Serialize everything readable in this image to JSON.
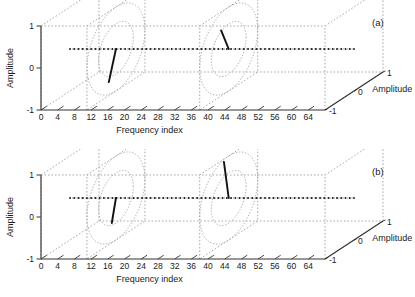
{
  "figure": {
    "kind": "3d-phasor-plot-pair",
    "background": "#ffffff",
    "ink": "#1a1a1a",
    "grid_color": "#9a9a9a"
  },
  "chart_data": [
    {
      "type": "line",
      "panel_label": "(a)",
      "title": "",
      "xlabel": "Frequency index",
      "ylabel": "Amplitude",
      "zlabel": "Amplitude",
      "xlim": [
        0,
        68
      ],
      "ylim": [
        -1,
        1
      ],
      "zlim": [
        -1,
        1
      ],
      "xticks": [
        0,
        4,
        8,
        12,
        16,
        20,
        24,
        28,
        32,
        36,
        40,
        44,
        48,
        52,
        56,
        60,
        64
      ],
      "xticklabels": [
        "0",
        "4",
        "8",
        "12",
        "16",
        "20",
        "24",
        "28",
        "32",
        "36",
        "40",
        "44",
        "48",
        "52",
        "56",
        "60",
        "64"
      ],
      "yticks": [
        -1,
        0,
        1
      ],
      "yticklabels": [
        "-1",
        "0",
        "1"
      ],
      "zticks": [
        -1,
        0,
        1
      ],
      "zticklabels": [
        "-1",
        "0",
        "1"
      ],
      "grid": true,
      "legend": "none",
      "series": [
        {
          "name": "spectrum-baseline",
          "style": "dotted-markers",
          "x_start": 0,
          "x_end": 68,
          "n_points": 68,
          "y": 0,
          "z": 0
        }
      ],
      "annotations": [
        {
          "name": "unit-circle-left",
          "kind": "circle",
          "frequency_index": 11,
          "radius": 1.0,
          "inner_radius": 0.6,
          "rings": 2
        },
        {
          "name": "phasor-left",
          "kind": "vector",
          "frequency_index": 11,
          "amplitude": 0.72,
          "angle_deg": 250
        },
        {
          "name": "unit-circle-right",
          "kind": "circle",
          "frequency_index": 38,
          "radius": 1.0,
          "inner_radius": 0.6,
          "rings": 2
        },
        {
          "name": "phasor-right",
          "kind": "vector",
          "frequency_index": 38,
          "amplitude": 0.62,
          "angle_deg": 115
        },
        {
          "name": "cut-plane-left",
          "kind": "plane",
          "frequency_index": 11
        },
        {
          "name": "cut-plane-right",
          "kind": "plane",
          "frequency_index": 38
        }
      ]
    },
    {
      "type": "line",
      "panel_label": "(b)",
      "title": "",
      "xlabel": "Frequency index",
      "ylabel": "Amplitude",
      "zlabel": "Amplitude",
      "xlim": [
        0,
        68
      ],
      "ylim": [
        -1,
        1
      ],
      "zlim": [
        -1,
        1
      ],
      "xticks": [
        0,
        4,
        8,
        12,
        16,
        20,
        24,
        28,
        32,
        36,
        40,
        44,
        48,
        52,
        56,
        60,
        64
      ],
      "xticklabels": [
        "0",
        "4",
        "8",
        "12",
        "16",
        "20",
        "24",
        "28",
        "32",
        "36",
        "40",
        "44",
        "48",
        "52",
        "56",
        "60",
        "64"
      ],
      "yticks": [
        -1,
        0,
        1
      ],
      "yticklabels": [
        "-1",
        "0",
        "1"
      ],
      "zticks": [
        -1,
        0,
        1
      ],
      "zticklabels": [
        "-1",
        "0",
        "1"
      ],
      "grid": true,
      "legend": "none",
      "series": [
        {
          "name": "spectrum-baseline",
          "style": "dotted-markers",
          "x_start": 0,
          "x_end": 68,
          "n_points": 68,
          "y": 0,
          "z": 0
        }
      ],
      "annotations": [
        {
          "name": "unit-circle-left",
          "kind": "circle",
          "frequency_index": 11,
          "radius": 1.0,
          "inner_radius": 0.6,
          "rings": 2
        },
        {
          "name": "phasor-left",
          "kind": "vector",
          "frequency_index": 11,
          "amplitude": 0.55,
          "angle_deg": 255
        },
        {
          "name": "unit-circle-right",
          "kind": "circle",
          "frequency_index": 38,
          "radius": 1.0,
          "inner_radius": 0.6,
          "rings": 2
        },
        {
          "name": "phasor-right",
          "kind": "vector",
          "frequency_index": 38,
          "amplitude": 0.95,
          "angle_deg": 100
        },
        {
          "name": "cut-plane-left",
          "kind": "plane",
          "frequency_index": 11
        },
        {
          "name": "cut-plane-right",
          "kind": "plane",
          "frequency_index": 38
        }
      ]
    }
  ],
  "panel_a": {
    "label": "(a)",
    "xlabel": "Frequency index",
    "ylabel": "Amplitude",
    "zlabel": "Amplitude",
    "xticklabels": [
      "0",
      "4",
      "8",
      "12",
      "16",
      "20",
      "24",
      "28",
      "32",
      "36",
      "40",
      "44",
      "48",
      "52",
      "56",
      "60",
      "64"
    ],
    "yticklabels": [
      "1",
      "0",
      "-1"
    ],
    "zticklabels": [
      "1",
      "0",
      "-1"
    ]
  },
  "panel_b": {
    "label": "(b)",
    "xlabel": "Frequency index",
    "ylabel": "Amplitude",
    "zlabel": "Amplitude",
    "xticklabels": [
      "0",
      "4",
      "8",
      "12",
      "16",
      "20",
      "24",
      "28",
      "32",
      "36",
      "40",
      "44",
      "48",
      "52",
      "56",
      "60",
      "64"
    ],
    "yticklabels": [
      "1",
      "0",
      "-1"
    ],
    "zticklabels": [
      "1",
      "0",
      "-1"
    ]
  }
}
